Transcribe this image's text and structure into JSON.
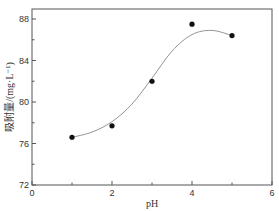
{
  "chart_data": {
    "type": "scatter",
    "title": "",
    "xlabel": "pH",
    "ylabel": "吸附量/(mg·L⁻¹)",
    "xlim": [
      0,
      6
    ],
    "ylim": [
      72,
      89
    ],
    "x_ticks": [
      0,
      2,
      4,
      6
    ],
    "y_ticks": [
      72,
      76,
      80,
      84,
      88
    ],
    "grid": false,
    "legend": null,
    "series": [
      {
        "name": "data",
        "marker": "filled-circle",
        "color": "#111111",
        "x": [
          1,
          2,
          3,
          4,
          5
        ],
        "values": [
          76.6,
          77.7,
          82.0,
          87.5,
          86.4
        ]
      },
      {
        "name": "fit",
        "style": "smooth-line",
        "color": "#888888",
        "x": [
          1,
          1.5,
          2,
          2.5,
          3,
          3.5,
          4,
          4.5,
          5
        ],
        "values": [
          76.6,
          77.1,
          78.1,
          79.8,
          82.3,
          84.9,
          86.5,
          86.9,
          86.4
        ]
      }
    ]
  },
  "labels": {
    "xlabel": "pH",
    "ylabel": "吸附量/(mg·L⁻¹)",
    "x_ticks": [
      "0",
      "2",
      "4",
      "6"
    ],
    "y_ticks": [
      "72",
      "76",
      "80",
      "84",
      "88"
    ]
  }
}
